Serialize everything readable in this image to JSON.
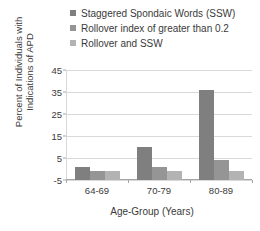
{
  "chart_data": {
    "type": "bar",
    "title": "",
    "xlabel": "Age-Group (Years)",
    "ylabel": "Percent of Individuals with Indications of APD",
    "ylabel_line1": "Percent of Individuals with",
    "ylabel_line2": "Indications of APD",
    "categories": [
      "64-69",
      "70-79",
      "80-89"
    ],
    "yticks": [
      45,
      35,
      25,
      15,
      5,
      -5
    ],
    "ylim": [
      -5,
      45
    ],
    "grid": true,
    "legend_position": "top",
    "series": [
      {
        "name": "Staggered Spondaic Words (SSW)",
        "color": "#7f7f7f",
        "values": [
          1,
          10,
          36
        ]
      },
      {
        "name": "Rollover index of greater than 0.2",
        "color": "#959595",
        "values": [
          -1,
          1,
          4
        ]
      },
      {
        "name": "Rollover and SSW",
        "color": "#b3b3b3",
        "values": [
          -1,
          -1,
          -1
        ]
      }
    ]
  },
  "colors": {
    "grid": "#d9d9d9",
    "axis": "#a6a6a6",
    "text": "#3a3a3a",
    "background": "#ffffff"
  }
}
